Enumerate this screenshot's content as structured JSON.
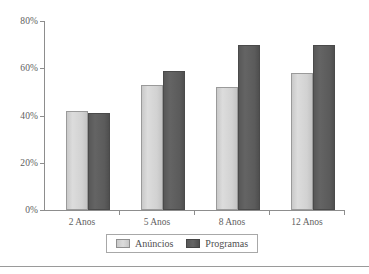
{
  "chart_data": {
    "type": "bar",
    "title": "",
    "subtitle": "",
    "xlabel": "",
    "ylabel": "",
    "categories": [
      "2 Anos",
      "5 Anos",
      "8 Anos",
      "12 Anos"
    ],
    "series": [
      {
        "name": "Anúncios",
        "color": "#d2d2d2",
        "values": [
          42,
          53,
          52,
          58
        ]
      },
      {
        "name": "Programas",
        "color": "#5a5a5a",
        "values": [
          41,
          59,
          70,
          70
        ]
      }
    ],
    "ylim": [
      0,
      80
    ],
    "yticks": [
      0,
      20,
      40,
      60,
      80
    ],
    "ytick_labels": [
      "0%",
      "20%",
      "40%",
      "60%",
      "80%"
    ],
    "grid": false,
    "legend_position": "bottom",
    "value_suffix": "%"
  },
  "legend": {
    "items": [
      {
        "label": "Anúncios",
        "swatch": "light-gray-swatch"
      },
      {
        "label": "Programas",
        "swatch": "dark-gray-swatch"
      }
    ]
  },
  "colors": {
    "series_light": "#d2d2d2",
    "series_dark": "#5a5a5a",
    "axis": "#8d8d8d",
    "text": "#5e5e5e",
    "background": "#ffffff"
  }
}
